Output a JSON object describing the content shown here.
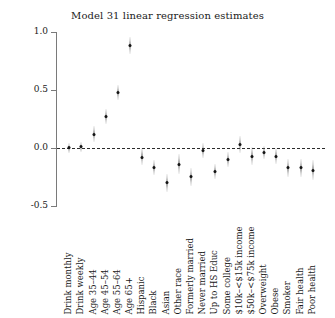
{
  "chart_data": {
    "type": "scatter",
    "title": "Model 31 linear regression estimates",
    "xlabel": "",
    "ylabel": "",
    "ylim": [
      -0.5,
      1.0
    ],
    "yticks": [
      1.0,
      0.5,
      0.0,
      -0.5
    ],
    "ytick_labels": [
      "1.0",
      "0.5",
      "0.0",
      "-0.5"
    ],
    "grid": false,
    "legend": null,
    "reference_line": 0.0,
    "reference_line_style": "dashed",
    "marker_style": "point-with-vertical-confidence-interval",
    "categories": [
      "Drink monthly",
      "Drink weekly",
      "Age 35–44",
      "Age 45–54",
      "Age 55–64",
      "Age 65+",
      "Hispanic",
      "Black",
      "Asian",
      "Other race",
      "Formerly married",
      "Never married",
      "Up to HS Educ",
      "Some college",
      "$10k–<$15k income",
      "$50k–<$75k income",
      "Overweight",
      "Obese",
      "Smoker",
      "Fair health",
      "Poor health"
    ],
    "values": [
      0.0,
      0.01,
      0.12,
      0.27,
      0.48,
      0.88,
      -0.08,
      -0.17,
      -0.3,
      -0.14,
      -0.25,
      -0.02,
      -0.2,
      -0.1,
      0.03,
      -0.07,
      -0.04,
      -0.07,
      -0.17,
      -0.17,
      -0.19
    ],
    "ci_low": [
      -0.02,
      -0.01,
      0.08,
      0.23,
      0.44,
      0.84,
      -0.12,
      -0.21,
      -0.35,
      -0.2,
      -0.3,
      -0.06,
      -0.24,
      -0.14,
      -0.02,
      -0.12,
      -0.07,
      -0.11,
      -0.22,
      -0.22,
      -0.25
    ],
    "ci_high": [
      0.02,
      0.03,
      0.16,
      0.31,
      0.52,
      0.93,
      -0.03,
      -0.13,
      -0.25,
      -0.08,
      -0.2,
      0.02,
      -0.16,
      -0.06,
      0.08,
      -0.02,
      -0.01,
      -0.03,
      -0.12,
      -0.12,
      -0.13
    ]
  }
}
